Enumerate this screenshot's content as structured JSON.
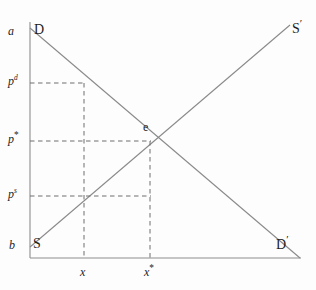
{
  "chart_data": {
    "type": "line",
    "title": "",
    "xlabel": "",
    "ylabel": "",
    "grid": false,
    "legend": "none",
    "axes": {
      "x_origin_px": 30,
      "y_origin_px": 258,
      "x_end_px": 300,
      "y_top_px": 22,
      "axis_color": "#8d8d8d"
    },
    "series": [
      {
        "name": "Demand",
        "label_start": "D",
        "label_end": "D′",
        "color": "#8a8a8a",
        "points_px": [
          [
            30,
            28
          ],
          [
            300,
            258
          ]
        ],
        "description": "Downward sloping demand curve from intercept a to D′"
      },
      {
        "name": "Supply",
        "label_start": "S",
        "label_end": "S′",
        "color": "#8a8a8a",
        "points_px": [
          [
            30,
            247
          ],
          [
            290,
            25
          ]
        ],
        "description": "Upward sloping supply curve from intercept b to S′"
      }
    ],
    "annotations": [
      {
        "name": "equilibrium-point",
        "label": "e",
        "x_px": 150,
        "y_px": 141
      },
      {
        "name": "demand-intercept",
        "label": "a",
        "x_px": 30,
        "y_px": 28
      },
      {
        "name": "supply-intercept",
        "label": "b",
        "x_px": 30,
        "y_px": 247
      }
    ],
    "price_levels": [
      {
        "name": "demand-price",
        "label": "p",
        "superscript": "d",
        "y_px": 83,
        "guide_to_x_px": 84
      },
      {
        "name": "equilibrium-price",
        "label": "p",
        "superscript": "*",
        "y_px": 141,
        "guide_to_x_px": 150
      },
      {
        "name": "supply-price",
        "label": "p",
        "superscript": "s",
        "y_px": 196,
        "guide_to_x_px": 150
      }
    ],
    "quantity_levels": [
      {
        "name": "taxed-quantity",
        "label": "x",
        "superscript": "",
        "x_px": 84,
        "guide_from_y_px": 83
      },
      {
        "name": "equilibrium-quantity",
        "label": "x",
        "superscript": "*",
        "x_px": 150,
        "guide_from_y_px": 141
      }
    ],
    "dashed_color": "#6f6f6f"
  },
  "labels": {
    "demand_intercept_a": "a",
    "supply_intercept_b": "b",
    "demand_curve_start": "D",
    "demand_curve_end": "D",
    "demand_curve_end_prime": "′",
    "supply_curve_start": "S",
    "supply_curve_end": "S",
    "supply_curve_end_prime": "′",
    "equilibrium": "e",
    "price_base": "p",
    "price_demand_sup": "d",
    "price_equilibrium_sup": "*",
    "price_supply_sup": "s",
    "quantity_base": "x",
    "quantity_equilibrium_sup": "*"
  }
}
